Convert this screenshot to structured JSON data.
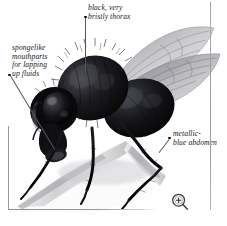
{
  "figure": {
    "name": "annotated-fly-photograph",
    "background_color": "#ffffff",
    "frame_color": "#9a9a9a"
  },
  "labels": {
    "thorax": {
      "text": "black, very\nbristly thorax",
      "bullet": "•"
    },
    "mouthparts": {
      "text": "spongelike\nmouthparts\nfor lapping\nup fluids",
      "bullet": "•"
    },
    "abdomen": {
      "text": "metallic-\nblue abdomen",
      "bullet": "•"
    }
  },
  "controls": {
    "zoom_icon": "magnifier-plus-icon"
  },
  "colors": {
    "body_black": "#0b0b0d",
    "body_highlight": "#6e6e74",
    "wing_gray": "#b6b6bb",
    "twig_gray": "#d2d2d4",
    "text": "#17171a",
    "leader": "#56565c"
  }
}
